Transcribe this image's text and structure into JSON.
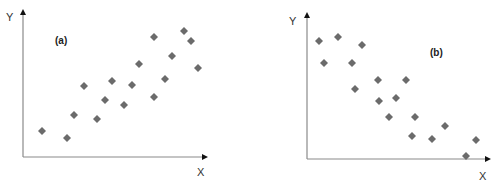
{
  "colors": {
    "marker": "#6b6b6b",
    "axis": "#8a8a8a",
    "arrow": "#111111",
    "text": "#333333",
    "panel_label": "#222222"
  },
  "chart_data": [
    {
      "type": "scatter",
      "title": "",
      "panel_label": "(a)",
      "xlabel": "X",
      "ylabel": "Y",
      "grid": false,
      "legend": null,
      "marker": "diamond",
      "trend": "positive correlation",
      "axis_px": {
        "origin": [
          23,
          157
        ],
        "x_end": 207,
        "y_top": 10
      },
      "label_px": {
        "panel": [
          55,
          44
        ],
        "xlabel": [
          197,
          176
        ],
        "ylabel": [
          6,
          21
        ]
      },
      "points_px": [
        [
          42,
          131
        ],
        [
          67,
          138
        ],
        [
          74,
          115
        ],
        [
          84,
          86
        ],
        [
          97,
          119
        ],
        [
          105,
          100
        ],
        [
          112,
          81
        ],
        [
          124,
          105
        ],
        [
          132,
          85
        ],
        [
          139,
          64
        ],
        [
          154,
          97
        ],
        [
          154,
          37
        ],
        [
          165,
          79
        ],
        [
          172,
          56
        ],
        [
          184,
          31
        ],
        [
          191,
          41
        ],
        [
          198,
          68
        ]
      ]
    },
    {
      "type": "scatter",
      "title": "",
      "panel_label": "(b)",
      "xlabel": "X",
      "ylabel": "Y",
      "grid": false,
      "legend": null,
      "marker": "diamond",
      "trend": "negative correlation",
      "axis_px": {
        "origin": [
          307,
          159
        ],
        "x_end": 490,
        "y_top": 13
      },
      "label_px": {
        "panel": [
          430,
          56
        ],
        "xlabel": [
          479,
          180
        ],
        "ylabel": [
          289,
          25
        ]
      },
      "points_px": [
        [
          319,
          41
        ],
        [
          324,
          63
        ],
        [
          338,
          37
        ],
        [
          352,
          63
        ],
        [
          355,
          89
        ],
        [
          362,
          45
        ],
        [
          378,
          80
        ],
        [
          379,
          101
        ],
        [
          389,
          117
        ],
        [
          396,
          98
        ],
        [
          406,
          80
        ],
        [
          412,
          136
        ],
        [
          415,
          117
        ],
        [
          432,
          139
        ],
        [
          445,
          126
        ],
        [
          466,
          156
        ],
        [
          476,
          140
        ]
      ]
    }
  ]
}
